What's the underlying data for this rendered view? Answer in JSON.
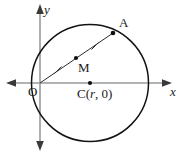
{
  "figure": {
    "width": 186,
    "height": 155,
    "background": "#ffffff"
  },
  "axes": {
    "axis_color": "#9a9a9a",
    "x_axis": {
      "label": "x",
      "y": 83,
      "x_start": 6,
      "x_end": 172,
      "arrow_left": true,
      "arrow_right": true
    },
    "y_axis": {
      "label": "y",
      "x": 40,
      "y_start": 5,
      "y_end": 150,
      "arrow_up": true,
      "arrow_down": true
    }
  },
  "circle": {
    "color": "#141414",
    "stroke_width": 1.4,
    "center": {
      "x": 90,
      "y": 83
    },
    "radius": 58.5,
    "center_label": "C(",
    "center_label_var": "r",
    "center_label_tail": ", 0)"
  },
  "points": [
    {
      "id": "O",
      "label": "O",
      "x": 40,
      "y": 83,
      "dot": false
    },
    {
      "id": "C",
      "label": "C(r, 0)",
      "x": 90,
      "y": 83,
      "dot": true
    },
    {
      "id": "M",
      "label": "M",
      "x": 76,
      "y": 58,
      "dot": true
    },
    {
      "id": "A",
      "label": "A",
      "x": 113,
      "y": 33,
      "dot": true
    }
  ],
  "chord": {
    "from": "O",
    "to": "A",
    "color": "#2b2b2b",
    "stroke_width": 1,
    "tick_marks": [
      {
        "x": 58,
        "y": 70
      },
      {
        "x": 95,
        "y": 46
      }
    ],
    "tick_note": "equal segments OM = MA"
  },
  "labels": {
    "y_axis": "y",
    "x_axis": "x",
    "origin": "O",
    "point_a": "A",
    "point_m": "M",
    "center_prefix": "C(",
    "center_var": "r",
    "center_suffix": ", 0)"
  }
}
